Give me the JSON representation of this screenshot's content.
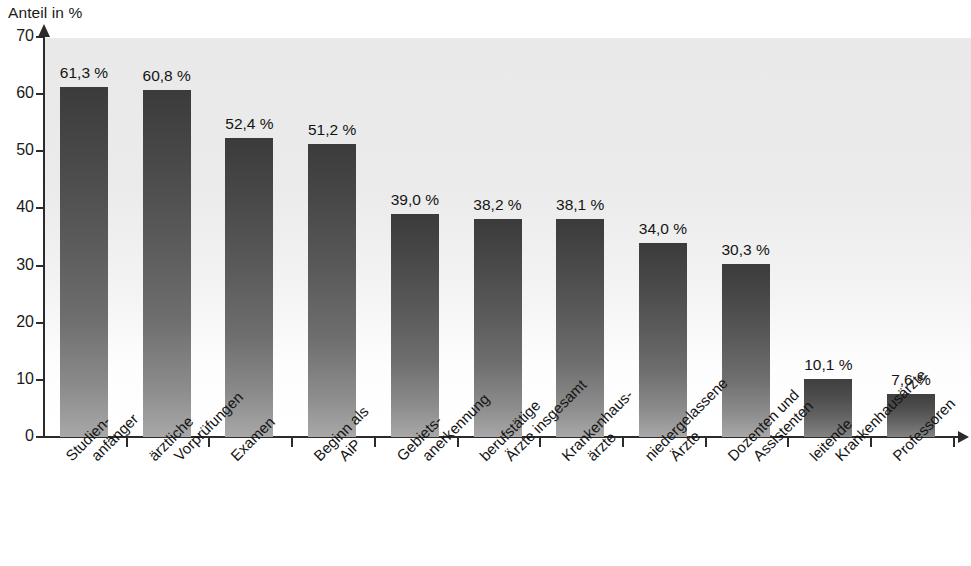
{
  "chart_data": {
    "type": "bar",
    "title": "",
    "ylabel": "Anteil in %",
    "xlabel": "",
    "ylim": [
      0,
      70
    ],
    "yticks": [
      0,
      10,
      20,
      30,
      40,
      50,
      60,
      70
    ],
    "grid": false,
    "legend": null,
    "value_suffix": " %",
    "decimal_separator": ",",
    "categories": [
      "Studien-\nanfänger",
      "ärztliche\nVorprüfungen",
      "Examen",
      "Beginn als\nAiP",
      "Gebiets-\nanerkennung",
      "berufstätige\nÄrzte insgesamt",
      "Krankenhaus-\närzte",
      "niedergelassene\nÄrzte",
      "Dozenten und\nAssistenten",
      "leitende\nKrankenhausärzte",
      "Professoren"
    ],
    "values": [
      61.3,
      60.8,
      52.4,
      51.2,
      39.0,
      38.2,
      38.1,
      34.0,
      30.3,
      10.1,
      7.6
    ],
    "value_labels": [
      "61,3 %",
      "60,8 %",
      "52,4 %",
      "51,2 %",
      "39,0 %",
      "38,2 %",
      "38,1 %",
      "34,0 %",
      "30,3 %",
      "10,1 %",
      "7,6 %"
    ]
  },
  "axis": {
    "y_title": "Anteil in %",
    "y_tick_labels": [
      "0",
      "10",
      "20",
      "30",
      "40",
      "50",
      "60",
      "70"
    ]
  },
  "categories_lines": [
    {
      "l1": "Studien-",
      "l2": "anfänger"
    },
    {
      "l1": "ärztliche",
      "l2": "Vorprüfungen"
    },
    {
      "l1": "Examen",
      "l2": ""
    },
    {
      "l1": "Beginn als",
      "l2": "AiP"
    },
    {
      "l1": "Gebiets-",
      "l2": "anerkennung"
    },
    {
      "l1": "berufstätige",
      "l2": "Ärzte insgesamt"
    },
    {
      "l1": "Krankenhaus-",
      "l2": "ärzte"
    },
    {
      "l1": "niedergelassene",
      "l2": "Ärzte"
    },
    {
      "l1": "Dozenten und",
      "l2": "Assistenten"
    },
    {
      "l1": "leitende",
      "l2": "Krankenhausärzte"
    },
    {
      "l1": "Professoren",
      "l2": ""
    }
  ],
  "colors": {
    "bar_top": "#3b3b3b",
    "bar_bottom": "#a8a8a8",
    "axis": "#2b2b2b",
    "plot_bg_top": "#e9e9e9",
    "plot_bg_bottom": "#ffffff",
    "text": "#141414"
  }
}
